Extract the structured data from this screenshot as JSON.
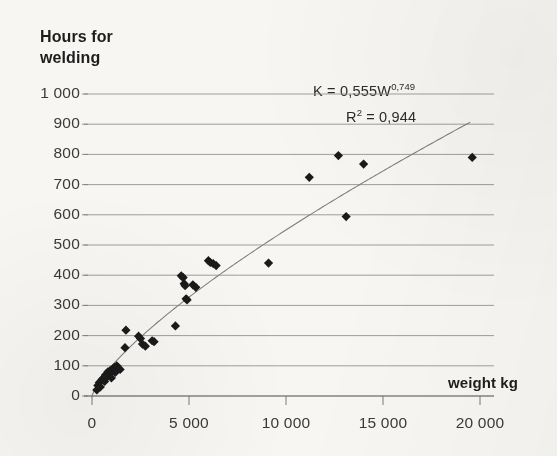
{
  "chart_data": {
    "type": "scatter",
    "title": "",
    "xlabel": "weight kg",
    "ylabel_line1": "Hours for",
    "ylabel_line2": "welding",
    "xlim": [
      0,
      20000
    ],
    "ylim": [
      0,
      1000
    ],
    "grid": "horizontal",
    "legend": "none",
    "marker": "diamond",
    "marker_color": "#1a1a1a",
    "trendline_color": "#7d7d7d",
    "annotations": [
      {
        "id": "equation",
        "text_base": "K = 0,555W",
        "text_sup": "0,749"
      },
      {
        "id": "r-squared",
        "text_base": "R",
        "text_sup": "2",
        "text_tail": " = 0,944"
      }
    ],
    "xticks": [
      {
        "value": 0,
        "label": "0"
      },
      {
        "value": 5000,
        "label": "5 000"
      },
      {
        "value": 10000,
        "label": "10 000"
      },
      {
        "value": 15000,
        "label": "15 000"
      },
      {
        "value": 20000,
        "label": "20 000"
      }
    ],
    "yticks": [
      {
        "value": 1000,
        "label": "1 000"
      },
      {
        "value": 900,
        "label": "900"
      },
      {
        "value": 800,
        "label": "800"
      },
      {
        "value": 700,
        "label": "700"
      },
      {
        "value": 600,
        "label": "600"
      },
      {
        "value": 500,
        "label": "500"
      },
      {
        "value": 400,
        "label": "400"
      },
      {
        "value": 300,
        "label": "300"
      },
      {
        "value": 200,
        "label": "200"
      },
      {
        "value": 100,
        "label": "100"
      },
      {
        "value": 0,
        "label": "0"
      }
    ],
    "points": [
      [
        250,
        20
      ],
      [
        300,
        35
      ],
      [
        380,
        45
      ],
      [
        430,
        30
      ],
      [
        520,
        55
      ],
      [
        600,
        60
      ],
      [
        650,
        48
      ],
      [
        700,
        70
      ],
      [
        760,
        62
      ],
      [
        820,
        80
      ],
      [
        880,
        72
      ],
      [
        950,
        85
      ],
      [
        1000,
        60
      ],
      [
        1080,
        90
      ],
      [
        1150,
        95
      ],
      [
        1200,
        78
      ],
      [
        1280,
        100
      ],
      [
        1350,
        92
      ],
      [
        1450,
        88
      ],
      [
        1700,
        160
      ],
      [
        1750,
        218
      ],
      [
        2400,
        198
      ],
      [
        2500,
        190
      ],
      [
        2600,
        172
      ],
      [
        2750,
        165
      ],
      [
        3100,
        183
      ],
      [
        3200,
        180
      ],
      [
        4300,
        232
      ],
      [
        4600,
        398
      ],
      [
        4700,
        392
      ],
      [
        4750,
        372
      ],
      [
        4800,
        365
      ],
      [
        4850,
        322
      ],
      [
        4900,
        318
      ],
      [
        5200,
        368
      ],
      [
        5350,
        360
      ],
      [
        6000,
        448
      ],
      [
        6100,
        442
      ],
      [
        6250,
        438
      ],
      [
        6400,
        432
      ],
      [
        9100,
        440
      ],
      [
        11200,
        724
      ],
      [
        12700,
        796
      ],
      [
        13100,
        594
      ],
      [
        14000,
        768
      ],
      [
        19600,
        790
      ]
    ],
    "trendline": {
      "formula": "K = 0,555 * W^0,749",
      "coefficient": 0.555,
      "exponent": 0.749,
      "r_squared": 0.944,
      "x_start": 0,
      "x_end": 19500
    }
  }
}
